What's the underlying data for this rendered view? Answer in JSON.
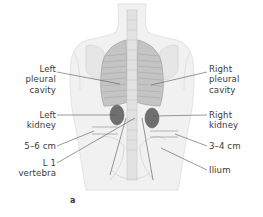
{
  "figure": {
    "panel_letter": "a",
    "view": "posterior view of torso",
    "colors": {
      "body_fill": "#efefef",
      "body_edge": "#d9d9d9",
      "lung_fill": "#bdbdbd",
      "lung_rib": "#9a9a9a",
      "kidney_fill": "#6e6e6e",
      "spine_fill": "#e3e3e3",
      "leader_line": "#555555",
      "level_line": "#8a8a8a",
      "label_text": "#3a3a3a"
    }
  },
  "labels": {
    "left_pleural_cavity": "Left\npleural\ncavity",
    "right_pleural_cavity": "Right\npleural\ncavity",
    "left_kidney": "Left\nkidney",
    "right_kidney": "Right\nkidney",
    "left_distance": "5–6 cm",
    "right_distance": "3–4 cm",
    "l1_vertebra": "L 1\nvertebra",
    "ilium": "Ilium"
  }
}
